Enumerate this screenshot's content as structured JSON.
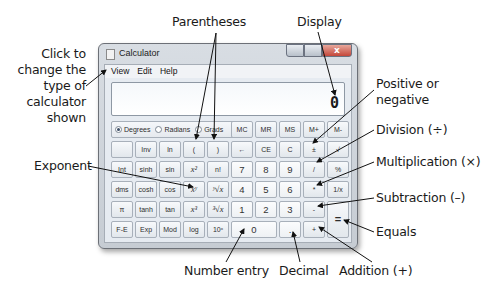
{
  "window": {
    "title": "Calculator",
    "close_glyph": "x",
    "menu": [
      "View",
      "Edit",
      "Help"
    ],
    "display_value": "0"
  },
  "angle_modes": {
    "options": [
      "Degrees",
      "Radians",
      "Grads"
    ],
    "selected": "Degrees"
  },
  "keys": {
    "row1": [
      "MC",
      "MR",
      "MS",
      "M+",
      "M-"
    ],
    "row2": [
      "",
      "Inv",
      "ln",
      "(",
      ")",
      "←",
      "CE",
      "C",
      "±",
      "√"
    ],
    "row3": [
      "Int",
      "sinh",
      "sin",
      "x²",
      "n!",
      "7",
      "8",
      "9",
      "/",
      "%"
    ],
    "row4": [
      "dms",
      "cosh",
      "cos",
      "xʸ",
      "ʸ√x",
      "4",
      "5",
      "6",
      "*",
      "1/x"
    ],
    "row5": [
      "π",
      "tanh",
      "tan",
      "x³",
      "³√x",
      "1",
      "2",
      "3",
      "-",
      "="
    ],
    "row6": [
      "F-E",
      "Exp",
      "Mod",
      "log",
      "10ˣ",
      "0",
      ".",
      "+"
    ]
  },
  "annotations": {
    "view_menu": [
      "Click to",
      "change the",
      "type of",
      "calculator",
      "shown"
    ],
    "parentheses": "Parentheses",
    "display": "Display",
    "sign": [
      "Positive or",
      "negative"
    ],
    "division": "Division (÷)",
    "multiplication": "Multiplication (×)",
    "subtraction": "Subtraction (–)",
    "equals": "Equals",
    "exponent": "Exponent",
    "number_entry": "Number entry",
    "decimal": "Decimal",
    "addition": "Addition (+)"
  }
}
